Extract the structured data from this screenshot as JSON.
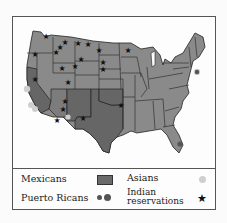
{
  "map": {
    "title": "",
    "colors": {
      "background": "#fdfdfd",
      "states": "#8a8a8a",
      "mexicans_region": "#666666",
      "borders": "#222222",
      "asians_dot": "#cfcfcf",
      "puerto_ricans_dot": "#555555",
      "reservation_star": "#111111"
    },
    "mexicans_states": [
      "California",
      "Arizona",
      "New Mexico",
      "Texas",
      "Oklahoma",
      "Colorado (south)"
    ],
    "asians_locations": [
      "San Francisco",
      "Los Angeles",
      "San Diego",
      "Seattle",
      "New York",
      "Arizona"
    ],
    "puerto_ricans_locations": [
      "New York",
      "Florida"
    ]
  },
  "legend": {
    "mexicans": "Mexicans",
    "asians": "Asians",
    "puerto_ricans": "Puerto Ricans",
    "indian_line1": "Indian",
    "indian_line2": "reservations",
    "star_glyph": "★"
  }
}
